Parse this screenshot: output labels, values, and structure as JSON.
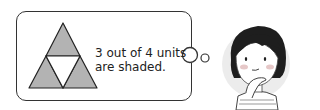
{
  "thought_bubble": {
    "text_line1": "3 out of 4 units",
    "text_line2": "are shaded."
  },
  "figure": {
    "total_units": 4,
    "shaded_units": 3,
    "shade_color": "#b3b3b3"
  },
  "character": {
    "description": "girl with short dark hair, hand on chin, thinking"
  }
}
